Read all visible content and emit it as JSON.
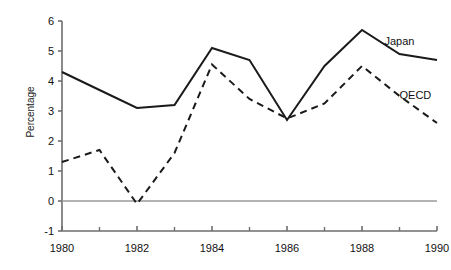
{
  "chart_data": {
    "type": "line",
    "title": "",
    "subtitle": "",
    "xlabel": "",
    "ylabel": "Percentage",
    "x": [
      1980,
      1981,
      1982,
      1983,
      1984,
      1985,
      1986,
      1987,
      1988,
      1989,
      1990
    ],
    "xlim": [
      1980,
      1990
    ],
    "ylim": [
      -1,
      6
    ],
    "x_major_ticks": [
      1980,
      1982,
      1984,
      1986,
      1988,
      1990
    ],
    "x_minor_ticks": [
      1981,
      1983,
      1985,
      1987,
      1989
    ],
    "x_tick_labels": [
      "1980",
      "1982",
      "1984",
      "1986",
      "1988",
      "1990"
    ],
    "y_ticks": [
      -1,
      0,
      1,
      2,
      3,
      4,
      5,
      6
    ],
    "y_tick_labels": [
      "-1",
      "0",
      "1",
      "2",
      "3",
      "4",
      "5",
      "6"
    ],
    "grid": false,
    "zero_line": true,
    "legend_position": "inline-right",
    "series": [
      {
        "name": "Japan",
        "label": "Japan",
        "style": "solid",
        "color": "#1a1a1a",
        "width": 2.0,
        "label_x": 1988.6,
        "label_y": 5.35,
        "values": [
          4.3,
          3.7,
          3.1,
          3.2,
          5.1,
          4.7,
          2.7,
          4.5,
          5.7,
          4.9,
          4.7
        ]
      },
      {
        "name": "OECD",
        "label": "OECD",
        "style": "dashed",
        "color": "#1a1a1a",
        "width": 2.0,
        "label_x": 1989.0,
        "label_y": 3.55,
        "values": [
          1.3,
          1.7,
          -0.1,
          1.6,
          4.55,
          3.4,
          2.75,
          3.25,
          4.5,
          3.5,
          2.6
        ]
      }
    ]
  },
  "colors": {
    "axis": "#6e6e6e",
    "zero_line": "#9a9a9a",
    "ink": "#1a1a1a",
    "background": "#ffffff"
  }
}
